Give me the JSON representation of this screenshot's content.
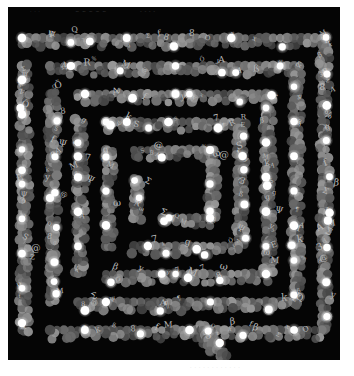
{
  "artwork": {
    "title": "Square spiral of circles and letters",
    "background": "#050505",
    "page_background": "#ffffff",
    "captions_top": [
      {
        "text": "· · ·",
        "x": 30
      },
      {
        "text": "~ ~ ~ ~ ~",
        "x": 75
      },
      {
        "text": "- - - -",
        "x": 140
      }
    ],
    "caption_bottom": "· · · · · · · · · · · ·",
    "palette": {
      "circle_shades": [
        "#5a5a5a",
        "#6a6a6a",
        "#7a7a7a",
        "#8a8a8a",
        "#969696",
        "#4c4c4c"
      ],
      "highlight": "#ffffff",
      "glow": "#e8e8e8",
      "glyph": "#b8b8b8"
    },
    "spiral": {
      "left": 22,
      "top": 38,
      "right": 322,
      "bottom": 330,
      "ring_step": 28,
      "circle_radius": 4.6,
      "dot_spacing": 7,
      "highlight_every": 5,
      "tail": [
        [
          200,
          325
        ],
        [
          205,
          335
        ],
        [
          212,
          345
        ],
        [
          222,
          354
        ]
      ]
    },
    "glyphs": [
      "E",
      "R",
      "S",
      "A",
      "M",
      "Q",
      "O",
      "k",
      "f",
      "ß",
      "&",
      "β",
      "%",
      "8",
      "¶",
      "Σ",
      "x",
      "y",
      "z",
      "7",
      "3",
      "g",
      "Ö",
      "@",
      "Ψ",
      "ω"
    ]
  }
}
